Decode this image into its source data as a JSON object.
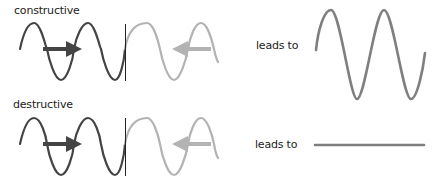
{
  "rows": [
    {
      "id": "constructive",
      "label": "constructive",
      "connector": "leads to",
      "result": "amplified-wave"
    },
    {
      "id": "destructive",
      "label": "destructive",
      "connector": "leads to",
      "result": "flat-line"
    }
  ],
  "colors": {
    "incoming_wave": "#444444",
    "reflected_wave": "#b3b3b3",
    "result_wave": "#7f7f7f",
    "divider": "#222222",
    "text": "#222222"
  }
}
